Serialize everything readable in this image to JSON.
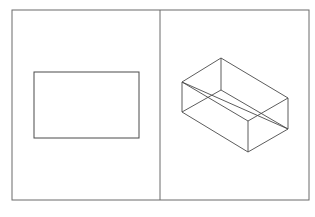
{
  "diagram": {
    "stroke_color": "#4a4a4a",
    "frame_color": "#6b6b6b",
    "panels": [
      {
        "id": "left",
        "shape": "rectangle",
        "label": ""
      },
      {
        "id": "right",
        "shape": "wireframe-box",
        "label": ""
      }
    ]
  }
}
